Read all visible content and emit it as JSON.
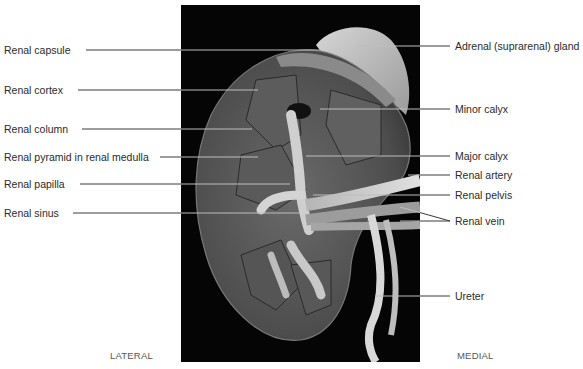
{
  "figure": {
    "orientation": {
      "left": "LATERAL",
      "right": "MEDIAL"
    },
    "photo_bounds": {
      "x": 181,
      "y": 5,
      "width": 239,
      "height": 357
    },
    "colors": {
      "background": "#ffffff",
      "photo_background": "#050505",
      "label_text": "#2a2a2a",
      "leader_line": "#3a3a3a",
      "leader_line_on_photo": "#bdbdbd"
    }
  },
  "labels_left": [
    {
      "text": "Renal capsule",
      "y": 50,
      "line_end_x": 320
    },
    {
      "text": "Renal cortex",
      "y": 90,
      "line_end_x": 258
    },
    {
      "text": "Renal column",
      "y": 129,
      "line_end_x": 252
    },
    {
      "text": "Renal pyramid in renal medulla",
      "y": 157,
      "line_end_x": 258
    },
    {
      "text": "Renal papilla",
      "y": 184,
      "line_end_x": 290
    },
    {
      "text": "Renal sinus",
      "y": 213,
      "line_end_x": 300
    }
  ],
  "labels_right": [
    {
      "text": "Adrenal (suprarenal) gland",
      "y": 46,
      "line_start_x": 355
    },
    {
      "text": "Minor calyx",
      "y": 109,
      "line_start_x": 320
    },
    {
      "text": "Major calyx",
      "y": 156,
      "line_start_x": 306
    },
    {
      "text": "Renal artery",
      "y": 175,
      "line_start_x": 408
    },
    {
      "text": "Renal pelvis",
      "y": 195,
      "line_start_x": 313
    },
    {
      "text": "Renal vein",
      "y": 221,
      "line_start_x": 400,
      "fork": [
        {
          "x": 400,
          "y": 207
        },
        {
          "x": 400,
          "y": 221
        }
      ]
    },
    {
      "text": "Ureter",
      "y": 296,
      "line_start_x": 375
    }
  ]
}
